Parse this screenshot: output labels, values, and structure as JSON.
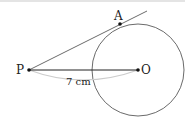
{
  "diagram": {
    "points": {
      "P": {
        "label": "P",
        "x": 29,
        "y": 70
      },
      "O": {
        "label": "O",
        "x": 138,
        "y": 70
      },
      "A": {
        "label": "A",
        "x": 120,
        "y": 24
      }
    },
    "circle": {
      "center": "O",
      "radius": 46
    },
    "segments": [
      {
        "from": "P",
        "to": "O",
        "label": "7 cm"
      },
      {
        "from": "P",
        "through": "A",
        "type": "tangent"
      }
    ],
    "measure_label": "7 cm",
    "colors": {
      "line": "#333333",
      "arc": "#cccccc",
      "point": "#111111"
    }
  }
}
